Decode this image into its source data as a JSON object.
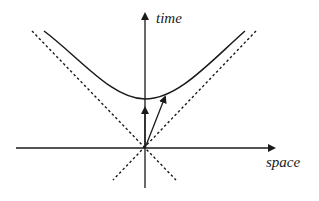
{
  "diagram": {
    "type": "spacetime-diagram",
    "labels": {
      "time_axis": "time",
      "space_axis": "space"
    },
    "elements": {
      "time_axis": {
        "from": [
          145,
          188
        ],
        "to": [
          145,
          10
        ],
        "arrow": true
      },
      "space_axis": {
        "from": [
          16,
          148
        ],
        "to": [
          278,
          148
        ],
        "arrow": true
      },
      "light_cone_left": {
        "from": [
          32,
          31
        ],
        "to": [
          176,
          180
        ],
        "style": "dotted"
      },
      "light_cone_right": {
        "from": [
          256,
          31
        ],
        "to": [
          113,
          180
        ],
        "style": "dotted"
      },
      "hyperbola": {
        "vertex": [
          145,
          99
        ],
        "left_end": [
          44,
          31
        ],
        "right_end": [
          245,
          31
        ]
      },
      "rest_vector": {
        "from": [
          145,
          148
        ],
        "to": [
          145,
          104
        ],
        "arrow": true
      },
      "boosted_vector": {
        "from": [
          145,
          148
        ],
        "to": [
          166,
          93
        ],
        "arrow": true
      }
    },
    "colors": {
      "stroke": "#1a1a1a",
      "background": "#ffffff"
    }
  }
}
